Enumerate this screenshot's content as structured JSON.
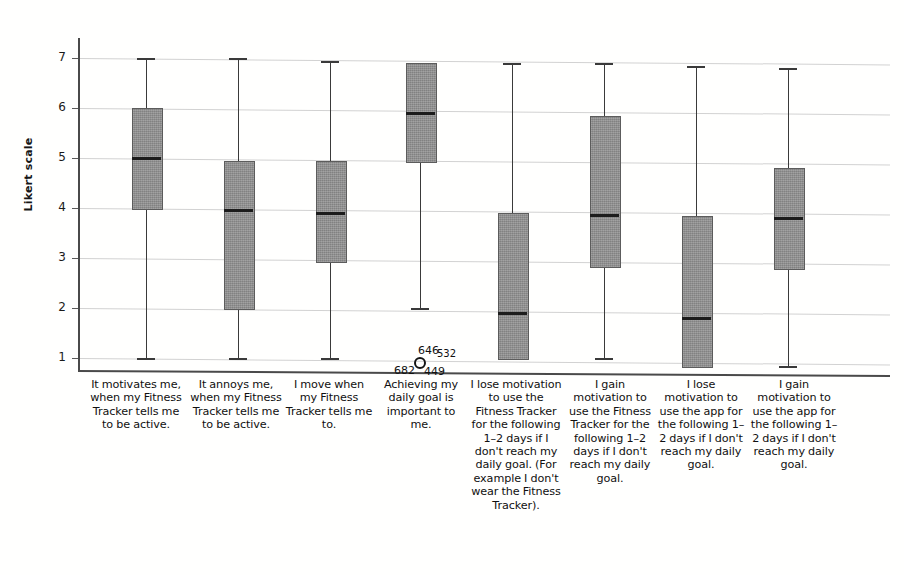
{
  "chart_data": {
    "type": "box",
    "title": "",
    "xlabel": "",
    "ylabel": "Likert scale",
    "ylim": [
      0.6,
      7.4
    ],
    "yticks": [
      "1",
      "2",
      "3",
      "4",
      "5",
      "6",
      "7"
    ],
    "grid": true,
    "legend": "none",
    "categories": [
      "It motivates me, when my Fitness Tracker tells me to be active.",
      "It annoys me, when my Fitness Tracker tells me to be active.",
      "I move when my Fitness Tracker tells me to.",
      "Achieving my daily goal is important to me.",
      "I lose motivation to use the Fitness Tracker for the following 1–2 days if I don't reach my daily goal. (For example I don't wear the Fitness Tracker).",
      "I gain motivation to use the Fitness Tracker for the following 1–2 days if I don't reach my daily goal.",
      "I lose motivation to use the app for the following 1–2 days if I don't reach my daily goal.",
      "I gain motivation to use the app for the following 1–2 days if I don't reach my daily goal."
    ],
    "boxes": [
      {
        "name": "box-1",
        "whisker_low": 1.0,
        "q1": 4.0,
        "median": 5.0,
        "q3": 6.0,
        "whisker_high": 7.0
      },
      {
        "name": "box-2",
        "whisker_low": 1.0,
        "q1": 2.0,
        "median": 3.95,
        "q3": 4.95,
        "whisker_high": 7.0
      },
      {
        "name": "box-3",
        "whisker_low": 1.0,
        "q1": 2.95,
        "median": 3.9,
        "q3": 4.95,
        "whisker_high": 6.95
      },
      {
        "name": "box-4",
        "whisker_low": 2.0,
        "q1": 4.95,
        "median": 5.9,
        "q3": 6.9,
        "whisker_high": 6.9
      },
      {
        "name": "box-5",
        "whisker_low": 1.0,
        "q1": 1.0,
        "median": 1.9,
        "q3": 3.9,
        "whisker_high": 6.9
      },
      {
        "name": "box-6",
        "whisker_low": 1.0,
        "q1": 2.85,
        "median": 3.85,
        "q3": 5.85,
        "whisker_high": 6.9
      },
      {
        "name": "box-7",
        "whisker_low": 0.85,
        "q1": 0.85,
        "median": 1.8,
        "q3": 3.85,
        "whisker_high": 6.85
      },
      {
        "name": "box-8",
        "whisker_low": 0.85,
        "q1": 2.8,
        "median": 3.8,
        "q3": 4.8,
        "whisker_high": 6.8
      }
    ],
    "outliers": [
      {
        "series": "box-4",
        "value": 1.0,
        "labels": [
          "646",
          "532",
          "682",
          "449"
        ]
      }
    ]
  },
  "axis": {
    "y_title": "Likert scale",
    "ticks": [
      "7",
      "6",
      "5",
      "4",
      "3",
      "2",
      "1"
    ]
  },
  "outlier_annotations": {
    "top_left": "646",
    "top_right": "532",
    "bottom_left": "682",
    "bottom_right": "449"
  },
  "categories": {
    "c1": "It motivates me, when my Fitness Tracker tells me to be active.",
    "c2": "It annoys me, when my Fitness Tracker tells me to be active.",
    "c3": "I move when my Fitness Tracker tells me to.",
    "c4": "Achieving my daily goal is important to me.",
    "c5": "I lose motivation to use the Fitness Tracker for the following 1–2 days if I don't reach my daily goal. (For example I don't wear the Fitness Tracker).",
    "c6": "I gain motivation to use the Fitness Tracker for the following 1–2 days if I don't reach my daily goal.",
    "c7": "I lose motivation to use the app for the following 1–2 days if I don't reach my daily goal.",
    "c8": "I gain motivation to use the app for the following 1–2 days if I don't reach my daily goal."
  },
  "colors": {
    "box_fill": "#8e8e8e",
    "box_edge": "#5c5c5c",
    "median": "#1c1c1c",
    "grid": "#d2d2d2",
    "axis": "#4a4a4a",
    "text": "#111111",
    "background": "#fffffe"
  }
}
